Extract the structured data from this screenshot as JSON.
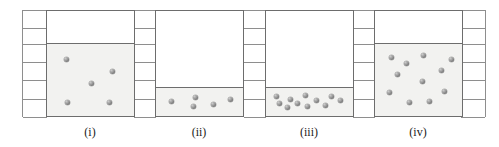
{
  "figure": {
    "canvas": {
      "width": 499,
      "height": 147
    },
    "colors": {
      "liquid_fill": "#f2f2f0",
      "container_stroke": "#6d6d6d",
      "grid_stroke": "#8e8e8e",
      "particle": "#8a8a8a",
      "caption_text": "#1b1b1b",
      "background": "#ffffff"
    },
    "grid": {
      "rows": 6,
      "row_boundaries_y": [
        10,
        28,
        44,
        62,
        80,
        99,
        117
      ],
      "blocks": [
        {
          "x": 22,
          "y": 10,
          "width": 26,
          "height": 107
        },
        {
          "x": 133,
          "y": 10,
          "width": 24,
          "height": 107
        },
        {
          "x": 243,
          "y": 10,
          "width": 24,
          "height": 107
        },
        {
          "x": 352,
          "y": 10,
          "width": 24,
          "height": 107
        },
        {
          "x": 460,
          "y": 10,
          "width": 26,
          "height": 107
        }
      ]
    },
    "containers": [
      {
        "id": "container-i",
        "label": "(i)",
        "x": 46,
        "y": 10,
        "width": 89,
        "height": 107,
        "fill_level_fraction": 0.68,
        "fill_height": 73,
        "particle_count": 5,
        "particles": [
          {
            "x": 0.17,
            "y": 0.17
          },
          {
            "x": 0.79,
            "y": 0.36
          },
          {
            "x": 0.5,
            "y": 0.56
          },
          {
            "x": 0.18,
            "y": 0.88
          },
          {
            "x": 0.75,
            "y": 0.89
          }
        ]
      },
      {
        "id": "container-ii",
        "label": "(ii)",
        "x": 155,
        "y": 10,
        "width": 89,
        "height": 107,
        "fill_level_fraction": 0.27,
        "fill_height": 29,
        "particle_count": 5,
        "particles": [
          {
            "x": 0.44,
            "y": 0.22
          },
          {
            "x": 0.91,
            "y": 0.38
          },
          {
            "x": 0.12,
            "y": 0.52
          },
          {
            "x": 0.68,
            "y": 0.7
          },
          {
            "x": 0.41,
            "y": 0.82
          }
        ]
      },
      {
        "id": "container-iii",
        "label": "(iii)",
        "x": 265,
        "y": 10,
        "width": 89,
        "height": 107,
        "fill_level_fraction": 0.27,
        "fill_height": 29,
        "particle_count": 11,
        "particles": [
          {
            "x": 0.05,
            "y": 0.17
          },
          {
            "x": 0.44,
            "y": 0.13
          },
          {
            "x": 0.78,
            "y": 0.18
          },
          {
            "x": 0.24,
            "y": 0.36
          },
          {
            "x": 0.59,
            "y": 0.44
          },
          {
            "x": 0.9,
            "y": 0.42
          },
          {
            "x": 0.09,
            "y": 0.62
          },
          {
            "x": 0.33,
            "y": 0.6
          },
          {
            "x": 0.47,
            "y": 0.82
          },
          {
            "x": 0.7,
            "y": 0.76
          },
          {
            "x": 0.2,
            "y": 0.88
          }
        ]
      },
      {
        "id": "container-iv",
        "label": "(iv)",
        "x": 374,
        "y": 10,
        "width": 89,
        "height": 107,
        "fill_level_fraction": 0.68,
        "fill_height": 73,
        "particle_count": 11,
        "particles": [
          {
            "x": 0.13,
            "y": 0.14
          },
          {
            "x": 0.56,
            "y": 0.1
          },
          {
            "x": 0.33,
            "y": 0.24
          },
          {
            "x": 0.8,
            "y": 0.35
          },
          {
            "x": 0.21,
            "y": 0.42
          },
          {
            "x": 0.54,
            "y": 0.54
          },
          {
            "x": 0.1,
            "y": 0.71
          },
          {
            "x": 0.84,
            "y": 0.7
          },
          {
            "x": 0.37,
            "y": 0.88
          },
          {
            "x": 0.64,
            "y": 0.87
          },
          {
            "x": 0.93,
            "y": 0.16
          }
        ]
      }
    ],
    "captions": [
      {
        "text": "(i)",
        "center_x": 90,
        "y": 126
      },
      {
        "text": "(ii)",
        "center_x": 199,
        "y": 126
      },
      {
        "text": "(iii)",
        "center_x": 309,
        "y": 126
      },
      {
        "text": "(iv)",
        "center_x": 418,
        "y": 126
      }
    ]
  }
}
